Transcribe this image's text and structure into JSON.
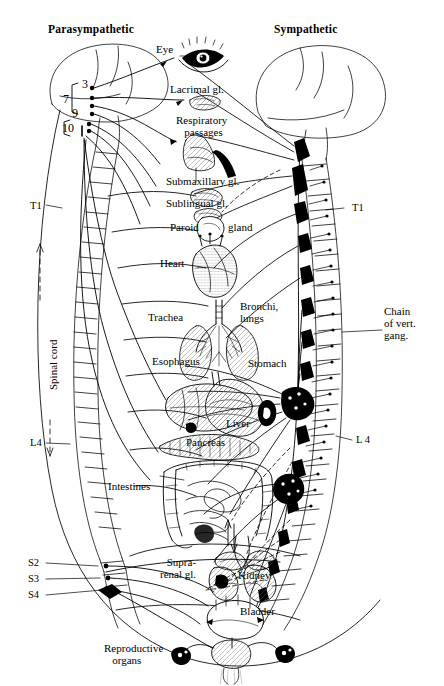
{
  "figure": {
    "type": "anatomical-diagram",
    "style": "black line art on white background",
    "width": 444,
    "height": 686
  },
  "headers": {
    "left": "Parasympathetic",
    "right": "Sympathetic"
  },
  "cranial_nerves": [
    {
      "id": "3",
      "label": "3"
    },
    {
      "id": "7",
      "label": "7"
    },
    {
      "id": "9",
      "label": "9"
    },
    {
      "id": "10",
      "label": "10"
    }
  ],
  "spinal_labels": {
    "cord": "Spinal cord",
    "left": [
      {
        "id": "t1-left",
        "label": "T1"
      },
      {
        "id": "l4-left",
        "label": "L4"
      },
      {
        "id": "s2",
        "label": "S2"
      },
      {
        "id": "s3",
        "label": "S3"
      },
      {
        "id": "s4",
        "label": "S4"
      }
    ],
    "right": [
      {
        "id": "t1-right",
        "label": "T1"
      },
      {
        "id": "l4-right",
        "label": "L 4"
      }
    ],
    "chain": "Chain\nof vert.\ngang."
  },
  "organs": [
    {
      "id": "eye",
      "label": "Eye"
    },
    {
      "id": "lacrimal-gland",
      "label": "Lacrimal gl."
    },
    {
      "id": "respiratory-passages",
      "label": "Respiratory\n   passages"
    },
    {
      "id": "submaxillary-gland",
      "label": "Submaxillary gl."
    },
    {
      "id": "sublingual-gland",
      "label": "Sublingual gl."
    },
    {
      "id": "parotid-gland-left",
      "label": "Paroid"
    },
    {
      "id": "parotid-gland-right",
      "label": "gland"
    },
    {
      "id": "heart",
      "label": "Heart"
    },
    {
      "id": "trachea",
      "label": "Trachea"
    },
    {
      "id": "bronchi-lungs",
      "label": "Bronchi,\nlungs"
    },
    {
      "id": "esophagus",
      "label": "Esophagus"
    },
    {
      "id": "stomach",
      "label": "Stomach"
    },
    {
      "id": "liver",
      "label": "Liver"
    },
    {
      "id": "pancreas",
      "label": "Pancreas"
    },
    {
      "id": "intestines",
      "label": "Intestines"
    },
    {
      "id": "suprarenal-gland",
      "label": "Supra-\nrenal gl."
    },
    {
      "id": "kidney",
      "label": "Kidney"
    },
    {
      "id": "bladder",
      "label": "Bladder"
    },
    {
      "id": "reproductive-organs",
      "label": "Reproductive\n   organs"
    }
  ],
  "colors": {
    "ink": "#000000",
    "background": "#ffffff",
    "hatch": "#555555"
  }
}
